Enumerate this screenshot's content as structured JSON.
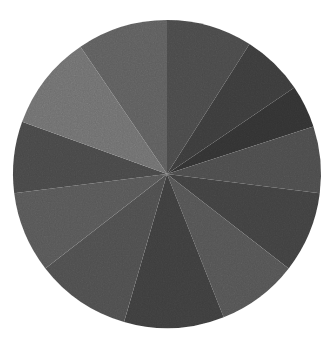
{
  "canvas": {
    "width": 336,
    "height": 346,
    "background": "#ffffff"
  },
  "chart_data": {
    "type": "pie",
    "title": "",
    "subtitle": "",
    "xlabel": "",
    "ylabel": "",
    "legend": "none",
    "grid": false,
    "labels_shown": false,
    "center_x": 167,
    "center_y": 174,
    "radius": 154,
    "start_angle_deg": -90,
    "direction": "clockwise",
    "total": 100,
    "categories": [
      "Slice 1",
      "Slice 2",
      "Slice 3",
      "Slice 4",
      "Slice 5",
      "Slice 6",
      "Slice 7",
      "Slice 8",
      "Slice 9",
      "Slice 10",
      "Slice 11",
      "Slice 12"
    ],
    "values": [
      9.0,
      6.5,
      4.5,
      7.0,
      8.5,
      8.5,
      10.5,
      10.0,
      8.5,
      7.5,
      10.0,
      9.5
    ],
    "colors": [
      "#494949",
      "#3a3a3a",
      "#333333",
      "#4b4b4b",
      "#3f3f3f",
      "#525252",
      "#3c3c3c",
      "#4e4e4e",
      "#565656",
      "#474747",
      "#6e6e6e",
      "#5d5d5d"
    ],
    "palette_name": "grayscale",
    "colors_hex_note": "grayscale wedge fills read from image"
  },
  "appearance": {
    "texture": "grainy",
    "edge": "soft",
    "stroke": "none"
  }
}
